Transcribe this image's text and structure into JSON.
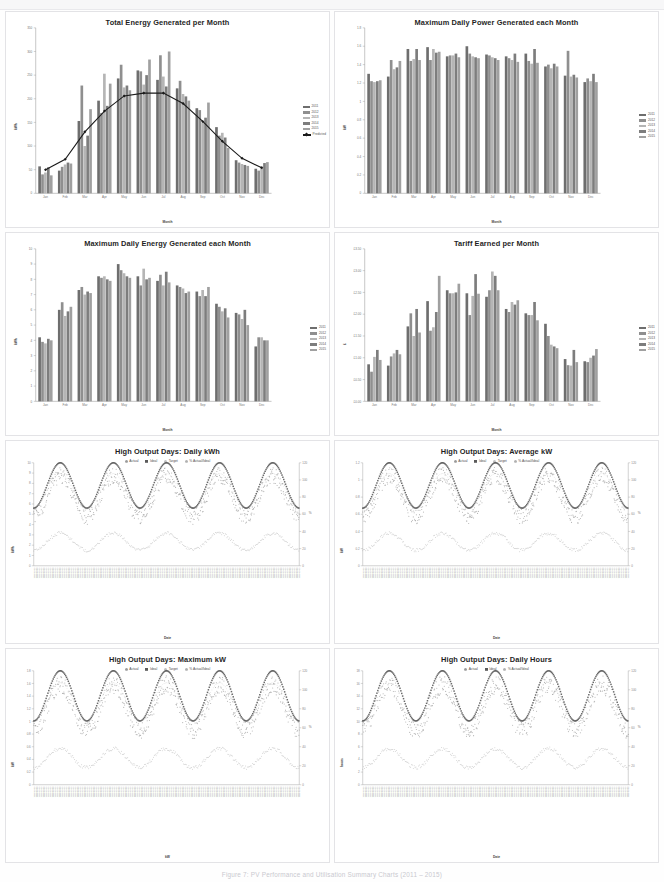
{
  "page": {
    "caption": "Figure 7: PV Performance and Utilisation Summary Charts (2011 – 2015)"
  },
  "palette": {
    "s2011": "#6e6e6e",
    "s2012": "#8f8f8f",
    "s2013": "#b5b5b5",
    "s2014": "#7d7d7d",
    "s2015": "#a0a0a0",
    "predicted": "#1a1a1a",
    "actual": "#9a9a9a",
    "ideal": "#5a5a5a",
    "target": "#c0c0c0",
    "pct": "#b0b0b0",
    "axis": "#8d8d8d",
    "grid": "#e6e6e6"
  },
  "charts": [
    {
      "id": "total-energy-per-month",
      "title": "Total Energy Generated per Month",
      "legend_position": "right",
      "chart_data": {
        "type": "bar",
        "title": "Total Energy Generated per Month",
        "xlabel": "Month",
        "ylabel": "kWh",
        "ylim": [
          0,
          350
        ],
        "yticks": [
          0,
          50,
          100,
          150,
          200,
          250,
          300,
          350
        ],
        "grid": false,
        "legend": [
          "2011",
          "2012",
          "2013",
          "2014",
          "2015",
          "Predicted"
        ],
        "categories": [
          "Jan",
          "Feb",
          "Mar",
          "Apr",
          "May",
          "Jun",
          "Jul",
          "Aug",
          "Sep",
          "Oct",
          "Nov",
          "Dec"
        ],
        "series": [
          {
            "name": "2011",
            "values": [
              57,
              48,
              153,
              196,
              243,
              260,
              240,
              222,
              180,
              140,
              70,
              52
            ]
          },
          {
            "name": "2012",
            "values": [
              40,
              56,
              228,
              170,
              272,
              258,
              292,
              238,
              176,
              122,
              65,
              48
            ]
          },
          {
            "name": "2013",
            "values": [
              44,
              61,
              100,
              253,
              224,
              230,
              247,
              210,
              150,
              128,
              62,
              57
            ]
          },
          {
            "name": "2014",
            "values": [
              55,
              65,
              122,
              185,
              228,
              250,
              226,
              205,
              160,
              118,
              60,
              64
            ]
          },
          {
            "name": "2015",
            "values": [
              38,
              63,
              178,
              232,
              218,
              283,
              300,
              196,
              192,
              96,
              58,
              66
            ]
          },
          {
            "name": "Predicted",
            "values": [
              50,
              72,
              130,
              174,
              206,
              212,
              212,
              190,
              152,
              110,
              74,
              54
            ]
          }
        ],
        "overlay_line": "Predicted"
      }
    },
    {
      "id": "max-daily-power-per-month",
      "title": "Maximum Daily Power Generated each Month",
      "legend_position": "right",
      "chart_data": {
        "type": "bar",
        "title": "Maximum Daily Power Generated each Month",
        "xlabel": "Month",
        "ylabel": "kW",
        "ylim": [
          0.0,
          1.8
        ],
        "yticks": [
          0.0,
          0.2,
          0.4,
          0.6,
          0.8,
          1.0,
          1.2,
          1.4,
          1.6,
          1.8
        ],
        "grid": false,
        "legend": [
          "2011",
          "2012",
          "2013",
          "2014",
          "2015"
        ],
        "categories": [
          "Jan",
          "Feb",
          "Mar",
          "Apr",
          "May",
          "Jun",
          "Jul",
          "Aug",
          "Sep",
          "Oct",
          "Nov",
          "Dec"
        ],
        "series": [
          {
            "name": "2011",
            "values": [
              1.3,
              1.27,
              1.57,
              1.59,
              1.49,
              1.6,
              1.51,
              1.49,
              1.52,
              1.38,
              1.28,
              1.21
            ]
          },
          {
            "name": "2012",
            "values": [
              1.22,
              1.45,
              1.44,
              1.45,
              1.5,
              1.52,
              1.5,
              1.47,
              1.44,
              1.4,
              1.55,
              1.25
            ]
          },
          {
            "name": "2013",
            "values": [
              1.21,
              1.35,
              1.46,
              1.57,
              1.5,
              1.49,
              1.48,
              1.45,
              1.41,
              1.36,
              1.27,
              1.22
            ]
          },
          {
            "name": "2014",
            "values": [
              1.22,
              1.37,
              1.57,
              1.53,
              1.52,
              1.48,
              1.47,
              1.52,
              1.57,
              1.41,
              1.29,
              1.3
            ]
          },
          {
            "name": "2015",
            "values": [
              1.23,
              1.44,
              1.45,
              1.54,
              1.48,
              1.47,
              1.45,
              1.43,
              1.42,
              1.38,
              1.26,
              1.21
            ]
          }
        ]
      }
    },
    {
      "id": "max-daily-energy-per-month",
      "title": "Maximum Daily Energy Generated each Month",
      "legend_position": "right",
      "chart_data": {
        "type": "bar",
        "title": "Maximum Daily Energy Generated each Month",
        "xlabel": "Month",
        "ylabel": "kWh",
        "ylim": [
          0,
          10
        ],
        "yticks": [
          0,
          1,
          2,
          3,
          4,
          5,
          6,
          7,
          8,
          9,
          10
        ],
        "grid": false,
        "legend": [
          "2011",
          "2012",
          "2013",
          "2014",
          "2015"
        ],
        "categories": [
          "Jan",
          "Feb",
          "Mar",
          "Apr",
          "May",
          "Jun",
          "Jul",
          "Aug",
          "Sep",
          "Oct",
          "Nov",
          "Dec"
        ],
        "series": [
          {
            "name": "2011",
            "values": [
              4.2,
              6.0,
              7.3,
              8.2,
              9.0,
              8.2,
              7.9,
              7.6,
              7.2,
              6.4,
              5.8,
              3.6
            ]
          },
          {
            "name": "2012",
            "values": [
              3.9,
              6.5,
              7.5,
              8.1,
              8.6,
              7.6,
              8.3,
              7.5,
              6.9,
              6.2,
              5.7,
              4.2
            ]
          },
          {
            "name": "2013",
            "values": [
              3.8,
              5.6,
              7.0,
              8.2,
              8.4,
              8.7,
              7.6,
              7.4,
              7.3,
              5.9,
              5.4,
              4.2
            ]
          },
          {
            "name": "2014",
            "values": [
              4.1,
              5.9,
              7.2,
              8.0,
              8.2,
              8.0,
              8.5,
              7.1,
              6.9,
              6.1,
              6.0,
              4.0
            ]
          },
          {
            "name": "2015",
            "values": [
              4.0,
              6.2,
              7.1,
              7.9,
              8.1,
              8.1,
              7.8,
              7.2,
              7.5,
              5.5,
              5.0,
              4.0
            ]
          }
        ]
      }
    },
    {
      "id": "tariff-earned-per-month",
      "title": "Tariff Earned per Month",
      "legend_position": "right",
      "chart_data": {
        "type": "bar",
        "title": "Tariff Earned per Month",
        "xlabel": "Month",
        "ylabel": "£",
        "ylim": [
          0.0,
          3.5
        ],
        "yticks": [
          "£0.00",
          "£0.50",
          "£1.00",
          "£1.50",
          "£2.00",
          "£2.50",
          "£3.00",
          "£3.50"
        ],
        "ytick_values": [
          0.0,
          0.5,
          1.0,
          1.5,
          2.0,
          2.5,
          3.0,
          3.5
        ],
        "grid": false,
        "legend": [
          "2011",
          "2012",
          "2013",
          "2014",
          "2015"
        ],
        "categories": [
          "Jan",
          "Feb",
          "Mar",
          "Apr",
          "May",
          "Jun",
          "Jul",
          "Aug",
          "Sep",
          "Oct",
          "Nov",
          "Dec"
        ],
        "series": [
          {
            "name": "2011",
            "values": [
              0.85,
              0.82,
              1.72,
              2.3,
              2.55,
              2.48,
              2.4,
              2.12,
              2.02,
              1.78,
              0.97,
              0.92
            ]
          },
          {
            "name": "2012",
            "values": [
              0.68,
              1.03,
              2.02,
              1.62,
              2.48,
              1.98,
              2.55,
              2.05,
              1.98,
              1.5,
              0.83,
              0.9
            ]
          },
          {
            "name": "2013",
            "values": [
              1.02,
              1.1,
              1.5,
              1.7,
              2.48,
              2.42,
              2.98,
              2.28,
              1.98,
              1.3,
              0.82,
              1.0
            ]
          },
          {
            "name": "2014",
            "values": [
              1.18,
              1.18,
              2.12,
              2.05,
              2.5,
              2.92,
              2.88,
              2.22,
              2.28,
              1.26,
              1.18,
              1.05
            ]
          },
          {
            "name": "2015",
            "values": [
              0.95,
              1.08,
              1.58,
              2.88,
              2.7,
              2.47,
              2.55,
              2.32,
              1.86,
              1.22,
              0.9,
              1.2
            ]
          }
        ]
      }
    },
    {
      "id": "high-output-days-daily-kwh",
      "title": "High Output Days: Daily kWh",
      "legend_position": "top",
      "chart_data": {
        "type": "scatter",
        "title": "High Output Days: Daily kWh",
        "xlabel": "Date",
        "ylabel": "kWh",
        "ylim": [
          0,
          10
        ],
        "yticks": [
          0,
          1,
          2,
          3,
          4,
          5,
          6,
          7,
          8,
          9,
          10
        ],
        "y2lim": [
          0,
          120
        ],
        "y2ticks": [
          0,
          20,
          40,
          60,
          80,
          100,
          120
        ],
        "y2label": "%",
        "grid": false,
        "legend": [
          "Actual",
          "Ideal",
          "Target",
          "% Actual/Ideal"
        ],
        "series": [
          {
            "name": "Actual",
            "marker": "dot-small",
            "color": "#9a9a9a"
          },
          {
            "name": "Ideal",
            "marker": "square",
            "color": "#5a5a5a"
          },
          {
            "name": "Target",
            "marker": "dot-small",
            "color": "#c0c0c0"
          },
          {
            "name": "% Actual/Ideal",
            "marker": "dot-small",
            "color": "#b0b0b0"
          }
        ],
        "x_ticks_note": "dense daily date labels, rotated vertical",
        "cycles": 5
      }
    },
    {
      "id": "high-output-days-average-kw",
      "title": "High Output Days: Average kW",
      "legend_position": "top",
      "chart_data": {
        "type": "scatter",
        "title": "High Output Days: Average kW",
        "xlabel": "Date",
        "ylabel": "kW",
        "ylim": [
          0.0,
          1.2
        ],
        "yticks": [
          0.0,
          0.2,
          0.4,
          0.6,
          0.8,
          1.0,
          1.2
        ],
        "y2lim": [
          0,
          120
        ],
        "y2ticks": [
          0,
          20,
          40,
          60,
          80,
          100,
          120
        ],
        "y2label": "%",
        "grid": false,
        "legend": [
          "Actual",
          "Ideal",
          "Target",
          "% Actual/Ideal"
        ],
        "series": [
          {
            "name": "Actual",
            "marker": "dot-small",
            "color": "#9a9a9a"
          },
          {
            "name": "Ideal",
            "marker": "square",
            "color": "#5a5a5a"
          },
          {
            "name": "Target",
            "marker": "dot-small",
            "color": "#c0c0c0"
          },
          {
            "name": "% Actual/Ideal",
            "marker": "dot-small",
            "color": "#b0b0b0"
          }
        ],
        "x_ticks_note": "dense daily date labels, rotated vertical",
        "cycles": 5
      }
    },
    {
      "id": "high-output-days-maximum-kw",
      "title": "High Output Days: Maximum kW",
      "legend_position": "top",
      "chart_data": {
        "type": "scatter",
        "title": "High Output Days: Maximum kW",
        "xlabel": "kW",
        "ylabel": "kW",
        "ylim": [
          0.0,
          1.8
        ],
        "yticks": [
          0.0,
          0.2,
          0.4,
          0.6,
          0.8,
          1.0,
          1.2,
          1.4,
          1.6,
          1.8
        ],
        "y2lim": [
          0,
          120
        ],
        "y2ticks": [
          0,
          20,
          40,
          60,
          80,
          100,
          120
        ],
        "y2label": "%",
        "grid": false,
        "legend": [
          "Actual",
          "Ideal",
          "Target",
          "% Actual/Ideal"
        ],
        "series": [
          {
            "name": "Actual",
            "marker": "dot-small",
            "color": "#9a9a9a"
          },
          {
            "name": "Ideal",
            "marker": "square",
            "color": "#5a5a5a"
          },
          {
            "name": "Target",
            "marker": "dot-small",
            "color": "#c0c0c0"
          },
          {
            "name": "% Actual/Ideal",
            "marker": "dot-small",
            "color": "#b0b0b0"
          }
        ],
        "x_ticks_note": "dense daily date labels, rotated vertical",
        "cycles": 5
      }
    },
    {
      "id": "high-output-days-daily-hours",
      "title": "High Output Days: Daily Hours",
      "legend_position": "top",
      "chart_data": {
        "type": "scatter",
        "title": "High Output Days: Daily Hours",
        "xlabel": "Date",
        "ylabel": "hours",
        "ylim": [
          0,
          18
        ],
        "yticks": [
          0,
          2,
          4,
          6,
          8,
          10,
          12,
          14,
          16,
          18
        ],
        "y2lim": [
          0,
          120
        ],
        "y2ticks": [
          0,
          20,
          40,
          60,
          80,
          100,
          120
        ],
        "y2label": "%",
        "grid": false,
        "legend": [
          "Actual",
          "Ideal",
          "% Actual/Ideal"
        ],
        "series": [
          {
            "name": "Actual",
            "marker": "dot-small",
            "color": "#9a9a9a"
          },
          {
            "name": "Ideal",
            "marker": "square",
            "color": "#5a5a5a"
          },
          {
            "name": "% Actual/Ideal",
            "marker": "dot-small",
            "color": "#b0b0b0"
          }
        ],
        "x_ticks_note": "dense daily date labels, rotated vertical",
        "cycles": 5
      }
    }
  ]
}
